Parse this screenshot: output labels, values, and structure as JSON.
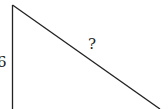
{
  "diagram": {
    "type": "right-triangle",
    "vertical_side_label": "6",
    "hypotenuse_label": "?",
    "line_color": "#222222"
  }
}
